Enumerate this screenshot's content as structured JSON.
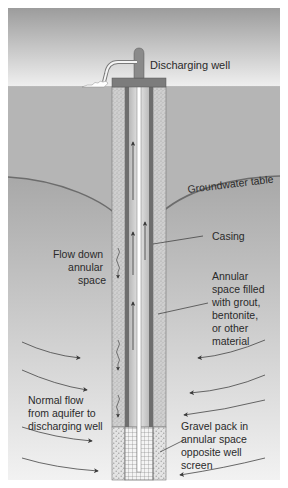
{
  "diagram": {
    "labels": {
      "discharging_well": "Discharging well",
      "groundwater_table": "Groundwater table",
      "casing": "Casing",
      "flow_down_annular_space": [
        "Flow down",
        "annular",
        "space"
      ],
      "annular_space_filled": [
        "Annular",
        "space filled",
        "with grout,",
        "bentonite,",
        "or other",
        "material"
      ],
      "normal_flow": [
        "Normal flow",
        "from aquifer to",
        "discharging well"
      ],
      "gravel_pack": [
        "Gravel pack in",
        "annular space",
        "opposite well",
        "screen"
      ]
    },
    "colors": {
      "sky_top": "#9a9a9a",
      "sky_bottom": "#f2f2f2",
      "soil": "#b4b4b4",
      "saturated_top": "#a6a6a6",
      "saturated_bottom": "#f0f0f0",
      "water_table_line": "#6f6f6f",
      "annulus": "#c8c8c8",
      "casing": "#6e6e6e",
      "pipe_interior": "#d8d8d8",
      "cap": "#7a7a7a",
      "text": "#2a2a2a"
    }
  }
}
